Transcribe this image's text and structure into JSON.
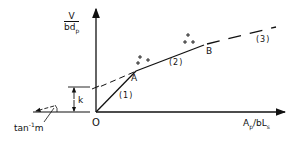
{
  "diagram": {
    "y_axis_label": {
      "numerator": "V",
      "denominator_base": "bd",
      "denominator_sub": "p"
    },
    "x_axis_label": {
      "a": "A",
      "a_sub": "p",
      "slash": "/bL",
      "l_sub": "s"
    },
    "origin_label": "O",
    "k_label": "k",
    "slope_label": {
      "base": "tan",
      "sup": "-1",
      "var": "m"
    },
    "points": [
      {
        "name": "A",
        "label": "A"
      },
      {
        "name": "B",
        "label": "B"
      }
    ],
    "segments": [
      {
        "id": "1",
        "label": "(1)",
        "style": "solid"
      },
      {
        "id": "2",
        "label": "(2)",
        "style": "solid"
      },
      {
        "id": "3",
        "label": "(3)",
        "style": "dashed"
      }
    ],
    "data_markers": {
      "symbol": "+",
      "groups": 2
    },
    "colors": {
      "line": "#111111",
      "background": "#ffffff"
    }
  }
}
